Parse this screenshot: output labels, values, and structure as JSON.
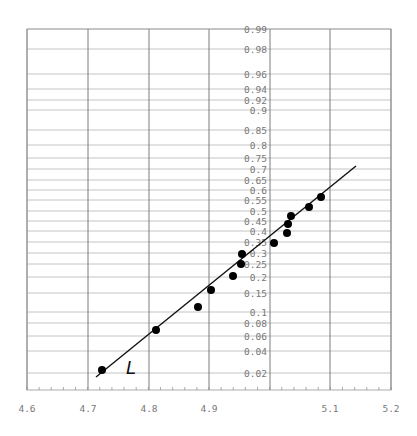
{
  "chart_data": {
    "type": "scatter",
    "title": "",
    "xlabel": "",
    "ylabel": "",
    "y_scale": "normal-probability",
    "xlim": [
      4.6,
      5.2
    ],
    "x_ticks": [
      4.6,
      4.7,
      4.8,
      4.9,
      5.0,
      5.1,
      5.2
    ],
    "x_tick_labels": [
      "4.6",
      "4.7",
      "4.8",
      "4.9",
      "",
      "5.1",
      "5.2"
    ],
    "y_ticks": [
      0.99,
      0.98,
      0.96,
      0.94,
      0.92,
      0.9,
      0.85,
      0.8,
      0.75,
      0.7,
      0.65,
      0.6,
      0.55,
      0.5,
      0.45,
      0.4,
      0.35,
      0.3,
      0.25,
      0.2,
      0.15,
      0.1,
      0.08,
      0.06,
      0.04,
      0.02
    ],
    "y_tick_labels": [
      "0.99",
      "0.98",
      "0.96",
      "0.94",
      "0.92",
      "0.9",
      "0.85",
      "0.8",
      "0.75",
      "0.7",
      "0.65",
      "0.6",
      "0.55",
      "0.5",
      "0.45",
      "0.4",
      "0.35",
      "0.3",
      "0.25",
      "0.2",
      "0.15",
      "0.1",
      "0.08",
      "0.06",
      "0.04",
      "0.02"
    ],
    "grid": true,
    "legend": null,
    "series": [
      {
        "name": "observations",
        "type": "scatter",
        "x": [
          4.723,
          4.812,
          4.882,
          4.903,
          4.939,
          4.952,
          4.954,
          5.007,
          5.028,
          5.03,
          5.035,
          5.065,
          5.085
        ],
        "y": [
          0.02,
          0.065,
          0.11,
          0.16,
          0.2,
          0.25,
          0.295,
          0.345,
          0.39,
          0.43,
          0.475,
          0.52,
          0.565
        ]
      },
      {
        "name": "L",
        "type": "line",
        "x": [
          4.714,
          5.142
        ],
        "y": [
          0.018,
          0.71
        ]
      }
    ],
    "annotations": [
      {
        "text": "L",
        "x": 4.76,
        "y": 0.021,
        "style": "italic"
      }
    ]
  },
  "pixel_layout": {
    "frame": {
      "left": 27,
      "right": 391,
      "top": 29,
      "bottom": 390
    },
    "x_px": {
      "4.6": 27,
      "4.7": 88,
      "4.8": 149,
      "4.9": 209,
      "5.0": 270,
      "5.1": 330,
      "5.2": 391
    },
    "y_px": {
      "0.99": 29,
      "0.98": 49,
      "0.96": 74,
      "0.94": 89,
      "0.92": 100,
      "0.9": 110,
      "0.85": 130,
      "0.8": 145,
      "0.75": 158,
      "0.7": 169,
      "0.65": 180,
      "0.6": 190,
      "0.55": 200,
      "0.5": 211,
      "0.45": 221,
      "0.4": 231,
      "0.35": 242,
      "0.3": 253,
      "0.25": 264,
      "0.2": 277,
      "0.15": 293,
      "0.1": 312,
      "0.08": 323,
      "0.06": 336,
      "0.04": 351,
      "0.02": 373
    },
    "points_px": [
      [
        102,
        370
      ],
      [
        156,
        330
      ],
      [
        198,
        307
      ],
      [
        211,
        290
      ],
      [
        233,
        276
      ],
      [
        241,
        264
      ],
      [
        242,
        254
      ],
      [
        274,
        243
      ],
      [
        287,
        233
      ],
      [
        288,
        224
      ],
      [
        291,
        216
      ],
      [
        309,
        207
      ],
      [
        321,
        197
      ]
    ],
    "line_px": [
      [
        96,
        377
      ],
      [
        356,
        166
      ]
    ],
    "annot_px": [
      126,
      374
    ]
  }
}
